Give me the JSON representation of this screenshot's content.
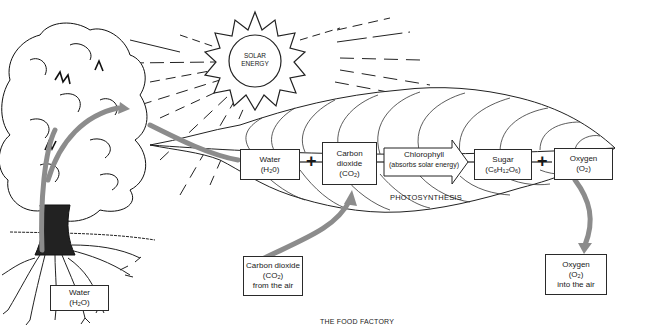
{
  "diagram": {
    "title": "THE FOOD FACTORY",
    "process_label": "PHOTOSYNTHESIS",
    "sun": {
      "line1": "SOLAR",
      "line2": "ENERGY"
    },
    "equation": {
      "water": {
        "line1": "Water",
        "formula_pre": "(H",
        "formula_sub": "2",
        "formula_post": "0)"
      },
      "plus1": "+",
      "carbon_dioxide": {
        "line1": "Carbon",
        "line2": "dioxide",
        "formula_pre": "(CO",
        "formula_sub": "2",
        "formula_post": ")"
      },
      "chlorophyll": {
        "line1": "Chlorophyll",
        "line2": "(absorbs solar energy)"
      },
      "sugar": {
        "line1": "Sugar",
        "formula": "(C6H12O6)",
        "f_c": "(C",
        "f_6a": "6",
        "f_h": "H",
        "f_12": "12",
        "f_o": "O",
        "f_6b": "6",
        "f_end": ")"
      },
      "plus2": "+",
      "oxygen": {
        "line1": "Oxygen",
        "formula_pre": "(O",
        "formula_sub": "2",
        "formula_post": ")"
      }
    },
    "inputs": {
      "root_water": {
        "line1": "Water",
        "formula_pre": "(H",
        "formula_sub": "2",
        "formula_post": "O)"
      },
      "co2_air": {
        "line1": "Carbon dioxide",
        "formula_pre": "(CO",
        "formula_sub": "2",
        "formula_post": ")",
        "line3": "from the air"
      }
    },
    "outputs": {
      "o2_air": {
        "line1": "Oxygen",
        "formula_pre": "(O",
        "formula_sub": "2",
        "formula_post": ")",
        "line3": "into the air"
      }
    },
    "colors": {
      "ink": "#1a1a1a",
      "arrow": "#8c8c8c",
      "background": "#ffffff"
    }
  }
}
